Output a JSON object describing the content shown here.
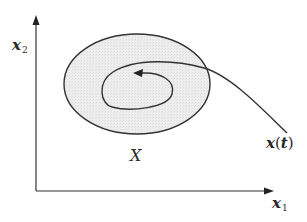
{
  "diagram": {
    "title": "",
    "axes": {
      "x_label": "x",
      "x_subscript": "1",
      "y_label": "x",
      "y_subscript": "2"
    },
    "region": {
      "label": "X",
      "fill_color": "#e6e6e6",
      "stroke_color": "#333333",
      "shape": "ellipse"
    },
    "trajectory": {
      "label_var": "x",
      "label_arg_open": "(",
      "label_arg": "t",
      "label_arg_close": ")",
      "description": "Trajectory entering region X from outside and spiraling inward",
      "stroke_color": "#333333"
    },
    "colors": {
      "background": "#ffffff",
      "ink": "#2a2a2a"
    }
  }
}
